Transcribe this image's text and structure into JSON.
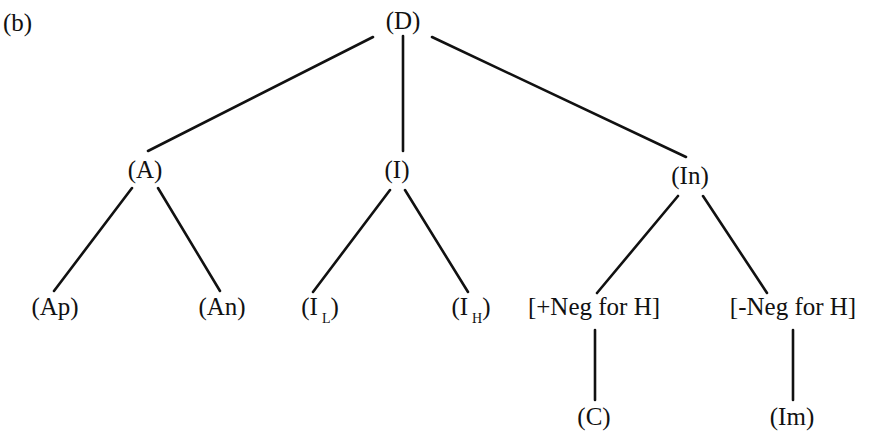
{
  "figure": {
    "panel_label": "(b)",
    "colors": {
      "line": "#111111",
      "text": "#111111",
      "background": "#ffffff"
    }
  },
  "tree": {
    "nodes": [
      {
        "id": "D",
        "text": "(D)",
        "x": 403,
        "y": 8
      },
      {
        "id": "A",
        "text": "(A)",
        "x": 145,
        "y": 157
      },
      {
        "id": "I",
        "text": "(I)",
        "x": 397,
        "y": 157
      },
      {
        "id": "In",
        "text": "(In)",
        "x": 690,
        "y": 163
      },
      {
        "id": "Ap",
        "text": "(Ap)",
        "x": 55,
        "y": 294
      },
      {
        "id": "An",
        "text": "(An)",
        "x": 222,
        "y": 294
      },
      {
        "id": "IL",
        "text": "(I",
        "sub": "L",
        "suffix": ")",
        "x": 320,
        "y": 294
      },
      {
        "id": "IH",
        "text": "(I",
        "sub": "H",
        "suffix": ")",
        "x": 471,
        "y": 294
      },
      {
        "id": "PosNeg",
        "text": "[+Neg for H]",
        "x": 594,
        "y": 294
      },
      {
        "id": "NegNeg",
        "text": "[-Neg for H]",
        "x": 793,
        "y": 294
      },
      {
        "id": "C",
        "text": "(C)",
        "x": 594,
        "y": 404
      },
      {
        "id": "Im",
        "text": "(Im)",
        "x": 792,
        "y": 404
      }
    ],
    "edges": [
      {
        "from": "D",
        "to": "A",
        "x1": 373,
        "y1": 37,
        "x2": 148,
        "y2": 151
      },
      {
        "from": "D",
        "to": "I",
        "x1": 403,
        "y1": 36,
        "x2": 403,
        "y2": 151
      },
      {
        "from": "D",
        "to": "In",
        "x1": 432,
        "y1": 37,
        "x2": 686,
        "y2": 157
      },
      {
        "from": "A",
        "to": "Ap",
        "x1": 132,
        "y1": 188,
        "x2": 54,
        "y2": 291
      },
      {
        "from": "A",
        "to": "An",
        "x1": 158,
        "y1": 188,
        "x2": 220,
        "y2": 291
      },
      {
        "from": "I",
        "to": "IL",
        "x1": 390,
        "y1": 190,
        "x2": 313,
        "y2": 292
      },
      {
        "from": "I",
        "to": "IH",
        "x1": 405,
        "y1": 190,
        "x2": 468,
        "y2": 292
      },
      {
        "from": "In",
        "to": "PosNeg",
        "x1": 678,
        "y1": 196,
        "x2": 597,
        "y2": 293
      },
      {
        "from": "In",
        "to": "NegNeg",
        "x1": 703,
        "y1": 196,
        "x2": 767,
        "y2": 293
      },
      {
        "from": "PosNeg",
        "to": "C",
        "x1": 595,
        "y1": 330,
        "x2": 595,
        "y2": 400
      },
      {
        "from": "NegNeg",
        "to": "Im",
        "x1": 793,
        "y1": 330,
        "x2": 793,
        "y2": 400
      }
    ]
  }
}
